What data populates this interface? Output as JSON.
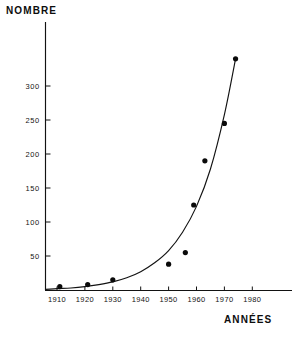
{
  "chart_data": {
    "type": "scatter",
    "title": "",
    "subtitle": "",
    "xlabel": "ANNÉES",
    "ylabel": "NOMBRE",
    "xlim": [
      1905,
      1985
    ],
    "ylim": [
      0,
      355
    ],
    "grid": false,
    "legend": false,
    "legend_position": "none",
    "x_ticks": [
      1910,
      1920,
      1930,
      1940,
      1950,
      1960,
      1970,
      1980
    ],
    "x_tick_labels": [
      "1910",
      "1920",
      "1930",
      "1940",
      "1950",
      "1960",
      "1970",
      "1980"
    ],
    "y_ticks": [
      50,
      100,
      150,
      200,
      250,
      300
    ],
    "y_tick_labels": [
      "50",
      "100",
      "150",
      "200",
      "250",
      "300"
    ],
    "series": [
      {
        "name": "points",
        "type": "scatter",
        "marker": "filled-circle",
        "color": "#0a0a0a",
        "x": [
          1911,
          1921,
          1930,
          1950,
          1956,
          1959,
          1963,
          1970,
          1974
        ],
        "y": [
          5,
          8,
          15,
          38,
          55,
          125,
          190,
          245,
          340
        ]
      },
      {
        "name": "fitted-exponential-curve",
        "type": "line",
        "color": "#131313",
        "x": [
          1906,
          1910,
          1915,
          1920,
          1925,
          1930,
          1935,
          1940,
          1945,
          1950,
          1955,
          1960,
          1965,
          1970,
          1974
        ],
        "y": [
          1,
          2,
          3,
          5,
          8,
          12,
          18,
          27,
          40,
          58,
          85,
          123,
          178,
          258,
          340
        ]
      }
    ],
    "annotations": []
  },
  "axes": {
    "y_axis_title": "NOMBRE",
    "x_axis_title": "ANNÉES"
  }
}
